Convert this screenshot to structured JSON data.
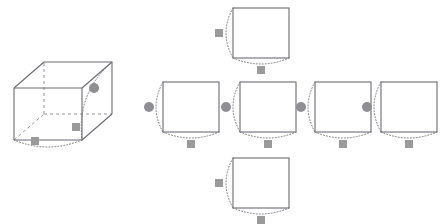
{
  "canvas": {
    "width": 447,
    "height": 224,
    "background": "#ffffff",
    "title": "Cube and its unfolded net with corner markers"
  },
  "style": {
    "solid_edge_color": "#6b6b75",
    "hidden_edge_color": "#8a8a93",
    "arc_color": "#7a7a82",
    "square_marker_fill": "#9a9a9a",
    "circle_marker_fill": "#8e8e93",
    "solid_edge_width": 1.1,
    "hidden_edge_width": 0.9,
    "arc_width": 1.0,
    "arc_dash": "1,2",
    "hidden_dash": "3,3",
    "square_marker_size": 8,
    "circle_marker_radius": 5
  },
  "cube": {
    "label": "wireframe-cube",
    "front_face": {
      "x": 14,
      "y": 88,
      "w": 68,
      "h": 52
    },
    "depth_offset": {
      "dx": 30,
      "dy": -26
    },
    "vertices": {
      "front_top_left": [
        14,
        88
      ],
      "front_top_right": [
        82,
        88
      ],
      "front_bottom_right": [
        82,
        140
      ],
      "front_bottom_left": [
        14,
        140
      ],
      "back_top_left": [
        44,
        62
      ],
      "back_top_right": [
        112,
        62
      ],
      "back_bottom_right": [
        112,
        114
      ],
      "back_bottom_left": [
        44,
        114
      ]
    },
    "solid_edges": [
      "front_top_left-front_top_right",
      "front_top_right-front_bottom_right",
      "front_bottom_right-front_bottom_left",
      "front_bottom_left-front_top_left",
      "back_top_left-back_top_right",
      "back_top_right-back_bottom_right",
      "front_top_left-back_top_left",
      "front_top_right-back_top_right",
      "front_bottom_right-back_bottom_right"
    ],
    "hidden_edges": [
      "back_bottom_left-back_top_left",
      "back_bottom_left-back_bottom_right",
      "front_bottom_left-back_bottom_left"
    ],
    "markers": [
      {
        "type": "circle",
        "name": "cube-circle-marker",
        "x": 94,
        "y": 88
      },
      {
        "type": "square",
        "name": "cube-square-marker-right",
        "x": 76,
        "y": 127
      },
      {
        "type": "square",
        "name": "cube-square-marker-bottom",
        "x": 35,
        "y": 141
      }
    ],
    "arcs": [
      {
        "name": "cube-arc-right",
        "from": [
          112,
          62
        ],
        "to": [
          82,
          140
        ],
        "bow": 22
      },
      {
        "name": "cube-arc-bottom",
        "from": [
          82,
          140
        ],
        "to": [
          14,
          140
        ],
        "bow": -14
      }
    ]
  },
  "net": {
    "label": "cube-net-cross-layout",
    "square_size": {
      "w": 56,
      "h": 50
    },
    "faces": [
      {
        "name": "net-face-top",
        "position": "top",
        "x": 233,
        "y": 8,
        "left_marker": "square",
        "bottom_marker": "square"
      },
      {
        "name": "net-face-middle-1",
        "position": "middle-left-outer",
        "x": 163,
        "y": 82,
        "left_marker": "circle",
        "bottom_marker": "square"
      },
      {
        "name": "net-face-middle-2",
        "position": "middle-left-inner",
        "x": 240,
        "y": 82,
        "left_marker": "circle",
        "bottom_marker": "square"
      },
      {
        "name": "net-face-middle-3",
        "position": "middle-right-inner",
        "x": 315,
        "y": 82,
        "left_marker": "circle",
        "bottom_marker": "square"
      },
      {
        "name": "net-face-middle-4",
        "position": "middle-right-outer",
        "x": 381,
        "y": 82,
        "left_marker": "circle",
        "bottom_marker": "square"
      },
      {
        "name": "net-face-bottom",
        "position": "bottom",
        "x": 233,
        "y": 158,
        "left_marker": "square",
        "bottom_marker": "square"
      }
    ]
  },
  "legend": {
    "circle_meaning": "circle-vertex-marker",
    "square_meaning": "square-vertex-marker",
    "arc_meaning": "fold-rotation-arc"
  }
}
